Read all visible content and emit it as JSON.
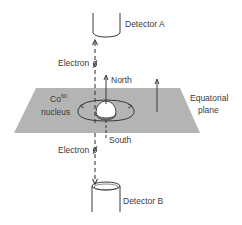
{
  "diagram": {
    "labels": {
      "detector_a": "Detector A",
      "detector_b": "Detector B",
      "electron_top": "Electron",
      "electron_bottom": "Electron",
      "north": "North",
      "south": "South",
      "nucleus_symbol": "Co",
      "nucleus_mass": "60",
      "nucleus_word": "nucleus",
      "plane_line1": "Equatorial",
      "plane_line2": "plane"
    },
    "colors": {
      "plane_fill": "#b4b4b4",
      "line": "#3a3a3a",
      "nucleus_fill": "#ffffff",
      "background": "#ffffff"
    },
    "elements": [
      {
        "id": "detector-a",
        "shape": "cup",
        "position": "top"
      },
      {
        "id": "detector-b",
        "shape": "cylinder",
        "position": "bottom"
      },
      {
        "id": "equatorial-plane",
        "shape": "parallelogram"
      },
      {
        "id": "co60-nucleus",
        "shape": "sphere"
      },
      {
        "id": "spin-axis",
        "direction": "north-up"
      },
      {
        "id": "electron-path",
        "style": "dashed",
        "directions": [
          "up",
          "down"
        ]
      }
    ]
  }
}
